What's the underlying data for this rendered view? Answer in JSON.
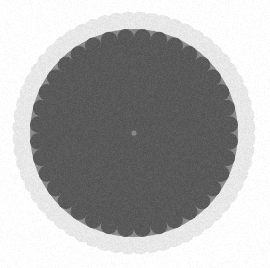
{
  "image": {
    "title": "Concentric Radial Dot Test Target",
    "width": 270,
    "height": 268,
    "background_color": "#ffffff",
    "rendering": {
      "blur_px": 0.7,
      "noise_amount": 0.055,
      "vignette": 0.06
    }
  },
  "chart_data": {
    "type": "scatter",
    "subtitle": "Polar array of gray dots with dark outer annulus ring of white dots",
    "xlabel": "",
    "ylabel": "",
    "grid": false,
    "legend_position": "none",
    "coordinate_system": "polar",
    "center": {
      "x": 134,
      "y": 133
    },
    "disk": {
      "radius": 119,
      "fill_color": "#8a8a8a",
      "edge_color": "#7e7e7e"
    },
    "outer_ring_band": {
      "inner_radius": 104,
      "outer_radius": 119,
      "fill_color": "#262626",
      "marker_color": "#e8e8e8",
      "marker_count": 60,
      "marker_radius_frac": 0.34,
      "marker_ring_radius": 111.5,
      "angle_offset_deg": 3
    },
    "dot_color": "#5a5a5a",
    "ring_growth_factor": 1.28,
    "base_ring_radius": 3.2,
    "ring_count": 17,
    "dots_per_ring": 36,
    "dot_size_ratio": 0.165,
    "angle_twist_deg": 5,
    "rings": [
      {
        "index": 0,
        "radius": 3.2,
        "dot_radius": 0.53,
        "count": 36,
        "angle_offset_deg": 0
      },
      {
        "index": 1,
        "radius": 4.1,
        "dot_radius": 0.68,
        "count": 36,
        "angle_offset_deg": 5
      },
      {
        "index": 2,
        "radius": 5.2,
        "dot_radius": 0.87,
        "count": 36,
        "angle_offset_deg": 10
      },
      {
        "index": 3,
        "radius": 6.7,
        "dot_radius": 1.11,
        "count": 36,
        "angle_offset_deg": 15
      },
      {
        "index": 4,
        "radius": 8.6,
        "dot_radius": 1.42,
        "count": 36,
        "angle_offset_deg": 20
      },
      {
        "index": 5,
        "radius": 11.0,
        "dot_radius": 1.81,
        "count": 36,
        "angle_offset_deg": 25
      },
      {
        "index": 6,
        "radius": 14.0,
        "dot_radius": 2.32,
        "count": 36,
        "angle_offset_deg": 30
      },
      {
        "index": 7,
        "radius": 18.0,
        "dot_radius": 2.97,
        "count": 36,
        "angle_offset_deg": 35
      },
      {
        "index": 8,
        "radius": 23.0,
        "dot_radius": 3.8,
        "count": 36,
        "angle_offset_deg": 40
      },
      {
        "index": 9,
        "radius": 29.4,
        "dot_radius": 4.86,
        "count": 36,
        "angle_offset_deg": 45
      },
      {
        "index": 10,
        "radius": 37.7,
        "dot_radius": 6.22,
        "count": 36,
        "angle_offset_deg": 50
      },
      {
        "index": 11,
        "radius": 48.2,
        "dot_radius": 7.95,
        "count": 36,
        "angle_offset_deg": 55
      },
      {
        "index": 12,
        "radius": 61.7,
        "dot_radius": 9.2,
        "count": 36,
        "angle_offset_deg": 60
      },
      {
        "index": 13,
        "radius": 74.0,
        "dot_radius": 9.4,
        "count": 36,
        "angle_offset_deg": 65
      },
      {
        "index": 14,
        "radius": 86.0,
        "dot_radius": 9.2,
        "count": 36,
        "angle_offset_deg": 70
      },
      {
        "index": 15,
        "radius": 96.0,
        "dot_radius": 8.4,
        "count": 36,
        "angle_offset_deg": 75
      },
      {
        "index": 16,
        "radius": 101.5,
        "dot_radius": 5.6,
        "count": 36,
        "angle_offset_deg": 80
      }
    ],
    "colors": {
      "background": "#ffffff",
      "disk": "#8a8a8a",
      "dots": "#5a5a5a",
      "ring_band": "#262626",
      "ring_markers": "#e8e8e8"
    }
  }
}
